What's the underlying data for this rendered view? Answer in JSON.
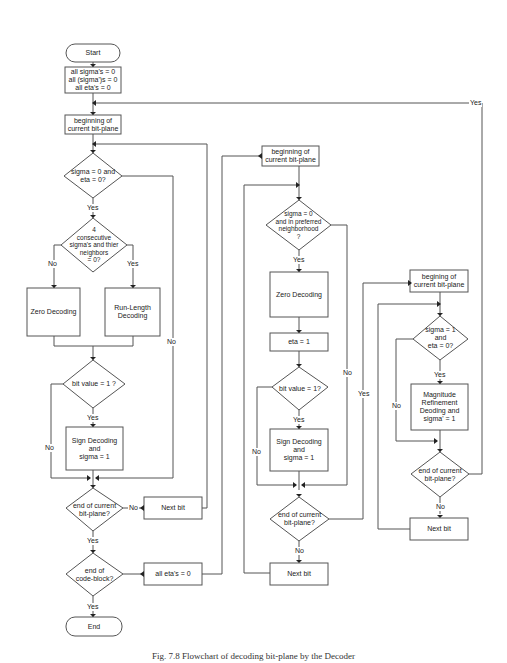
{
  "diagram": {
    "type": "flowchart",
    "left_column": {
      "start": "Start",
      "init": "all sigma's = 0\nall (sigma')s = 0\nall eta's = 0",
      "begin": "beginning of\ncurrent bit-plane",
      "decision1": "sigma = 0 and\neta = 0?",
      "decision2": "4\nconsecutive\nsigma's and thier\nneighbors\n= 0?",
      "zero_decoding": "Zero Decoding",
      "run_length": "Run-Length\nDecoding",
      "decision3": "bit value = 1 ?",
      "sign_decoding": "Sign Decoding\nand\nsigma = 1",
      "decision4": "end of current\nbit-plane?",
      "next_bit": "Next bit",
      "decision5": "end of\ncode-block?",
      "reset_eta": "all eta's = 0",
      "end": "End"
    },
    "middle_column": {
      "begin": "beginning of\ncurrent bit-plane",
      "decision1": "sigma = 0\nand in preferred\nneighborhood\n?",
      "zero_decoding": "Zero Decoding",
      "eta_set": "eta = 1",
      "decision2": "bit value = 1?",
      "sign_decoding": "Sign Decoding\nand\nsigma = 1",
      "decision3": "end of current\nbit-plane?",
      "next_bit": "Next bit"
    },
    "right_column": {
      "begin": "begining of\ncurrent bit-plane",
      "decision1": "sigma = 1\nand\neta = 0?",
      "magnitude": "Magnitude\nRefinement\nDeoding and\nsigma' = 1",
      "decision2": "end of current\nbit-plane?",
      "next_bit": "Next bit"
    },
    "edge_labels": {
      "yes": "Yes",
      "no": "No"
    }
  },
  "caption": "Fig. 7.8 Flowchart of decoding bit-plane by the Decoder"
}
